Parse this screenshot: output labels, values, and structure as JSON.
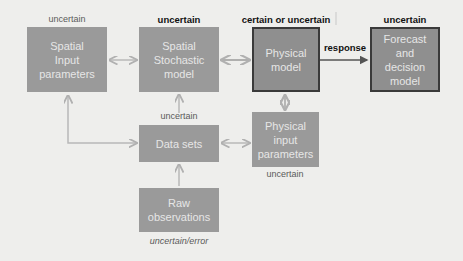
{
  "diagram": {
    "nodes": [
      {
        "id": "spatial-input",
        "label": "Spatial\nInput\nparameters",
        "annotation": "uncertain"
      },
      {
        "id": "spatial-stochastic",
        "label": "Spatial\nStochastic\nmodel",
        "annotation": "uncertain"
      },
      {
        "id": "physical-model",
        "label": "Physical\nmodel",
        "annotation": "certain or uncertain"
      },
      {
        "id": "forecast",
        "label": "Forecast\nand\ndecision\nmodel",
        "annotation": "uncertain"
      },
      {
        "id": "data-sets",
        "label": "Data sets",
        "annotation": "uncertain"
      },
      {
        "id": "physical-input",
        "label": "Physical\ninput\nparameters",
        "annotation": "uncertain"
      },
      {
        "id": "raw-observations",
        "label": "Raw\nobservations",
        "annotation": "uncertain/error"
      }
    ],
    "edges": [
      {
        "from": "spatial-input",
        "to": "spatial-stochastic",
        "type": "bidirectional"
      },
      {
        "from": "spatial-stochastic",
        "to": "physical-model",
        "type": "bidirectional"
      },
      {
        "from": "physical-model",
        "to": "forecast",
        "type": "directed",
        "label": "response"
      },
      {
        "from": "data-sets",
        "to": "spatial-stochastic",
        "type": "directed"
      },
      {
        "from": "spatial-input",
        "to": "data-sets",
        "type": "bidirectional"
      },
      {
        "from": "physical-input",
        "to": "data-sets",
        "type": "bidirectional"
      },
      {
        "from": "physical-input",
        "to": "physical-model",
        "type": "bidirectional"
      },
      {
        "from": "raw-observations",
        "to": "data-sets",
        "type": "directed"
      }
    ],
    "edge_label_response": "response"
  },
  "colors": {
    "box_fill": "#9a9a9a",
    "box_text": "#e6e6e6",
    "box_border_dark": "#3a3a3a",
    "arrow": "#b8b8b8",
    "arrow_dark": "#555555",
    "background": "#eeeeec"
  }
}
